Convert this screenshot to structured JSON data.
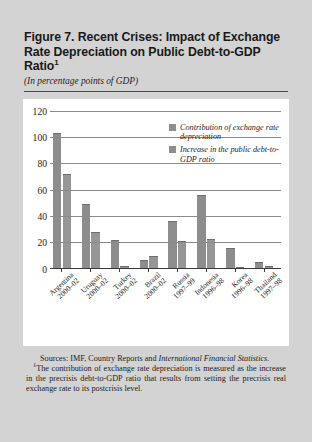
{
  "figure": {
    "title": "Figure 7. Recent Crises: Impact of Exchange Rate Depreciation on Public Debt-to-GDP Ratio",
    "title_footnote_marker": "1",
    "subtitle": "(In percentage points of GDP)"
  },
  "notes": {
    "sources_label": "Sources:",
    "sources_text": "IMF, Country Reports and",
    "sources_italic": "International Financial Statistics.",
    "footnote_marker": "1",
    "footnote_text": "The contribution of exchange rate depreciation is measured as the increase in the precrisis debt-to-GDP ratio that results from setting the precrisis real exchange rate to its postcrisis level."
  },
  "chart_data": {
    "type": "bar",
    "title": "Figure 7. Recent Crises: Impact of Exchange Rate Depreciation on Public Debt-to-GDP Ratio",
    "subtitle": "(In percentage points of GDP)",
    "xlabel": "",
    "ylabel": "",
    "ylim": [
      0,
      120
    ],
    "yticks": [
      0,
      20,
      40,
      60,
      80,
      100,
      120
    ],
    "ytick_labels": [
      "0",
      "20",
      "40",
      "60",
      "80",
      "100",
      "120"
    ],
    "grid": true,
    "grid_axis": "y",
    "legend_position": "top-right",
    "bar_color": "#909090",
    "categories": [
      "Argentina 2000–02",
      "Uruguay 2000–02",
      "Turkey 2000–02",
      "Brazil 2000–02",
      "Russia 1997–99",
      "Indonesia 1996–98",
      "Korea 1996–98",
      "Thailand 1997–98"
    ],
    "categories_split": [
      {
        "country": "Argentina",
        "period": "2000–02"
      },
      {
        "country": "Uruguay",
        "period": "2000–02"
      },
      {
        "country": "Turkey",
        "period": "2000–02"
      },
      {
        "country": "Brazil",
        "period": "2000–02"
      },
      {
        "country": "Russia",
        "period": "1997–99"
      },
      {
        "country": "Indonesia",
        "period": "1996–98"
      },
      {
        "country": "Korea",
        "period": "1996–98"
      },
      {
        "country": "Thailand",
        "period": "1997–98"
      }
    ],
    "series": [
      {
        "name": "Contribution of exchange rate depreciation",
        "color": "#8d8d8d",
        "values": [
          103,
          49,
          22,
          7,
          36,
          56,
          16,
          5
        ]
      },
      {
        "name": "Increase in the public debt-to-GDP ratio",
        "color": "#969696",
        "values": [
          72,
          28,
          2,
          10,
          21,
          23,
          1.5,
          2.5
        ]
      }
    ]
  }
}
